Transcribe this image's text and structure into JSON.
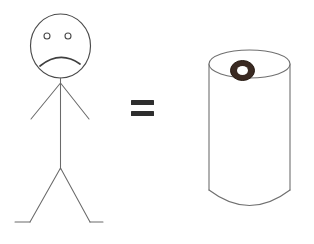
{
  "image": {
    "title": "Stick figure equals coffee cup",
    "background_color": "#ffffff",
    "width": 314,
    "height": 244,
    "style": "hand-drawn line sketch"
  },
  "elements": {
    "person": {
      "label": "sad stick figure person",
      "mood": "frowning",
      "stroke_color": "#5a5a5a",
      "head": {
        "label": "oval head",
        "center_x": 60.5,
        "center_y": 46,
        "radius_x": 30,
        "radius_y": 32
      },
      "eyes": [
        {
          "label": "left eye",
          "cx": 47,
          "cy": 36,
          "r": 3
        },
        {
          "label": "right eye",
          "cx": 68,
          "cy": 36,
          "r": 3
        }
      ],
      "mouth": {
        "label": "frowning mouth arc",
        "path": "M 40 66 Q 60 50 80 64",
        "stroke_color": "#3f3f3f"
      },
      "neck": {
        "x1": 60.5,
        "y1": 78,
        "x2": 60.5,
        "y2": 84
      },
      "torso": {
        "x1": 60.5,
        "y1": 82,
        "x2": 60.5,
        "y2": 169
      },
      "arms": [
        {
          "label": "left arm",
          "x1": 60.5,
          "y1": 83,
          "x2": 31,
          "y2": 119
        },
        {
          "label": "right arm",
          "x1": 60.5,
          "y1": 83,
          "x2": 89,
          "y2": 119
        }
      ],
      "legs": [
        {
          "label": "left leg",
          "x1": 60.5,
          "y1": 168,
          "x2": 30,
          "y2": 222
        },
        {
          "label": "right leg",
          "x1": 60.5,
          "y1": 168,
          "x2": 90,
          "y2": 222
        }
      ],
      "feet": [
        {
          "label": "left foot",
          "x1": 30,
          "y1": 222,
          "x2": 15,
          "y2": 222
        },
        {
          "label": "right foot",
          "x1": 90,
          "y1": 222,
          "x2": 103,
          "y2": 222
        }
      ]
    },
    "equals_sign": {
      "label": "equals sign",
      "symbol": "=",
      "color": "#2e2e2e",
      "bars": [
        {
          "x": 131,
          "y": 100,
          "width": 23,
          "height": 5
        },
        {
          "x": 131,
          "y": 111,
          "width": 23,
          "height": 5
        }
      ]
    },
    "cup": {
      "label": "coffee cup cylinder with dark ring on top",
      "stroke_color": "#6f6f6f",
      "top_ellipse": {
        "cx": 249.5,
        "cy": 64,
        "rx": 40.5,
        "ry": 14
      },
      "left_side": {
        "x1": 209,
        "y1": 64,
        "x2": 209,
        "y2": 190
      },
      "right_side": {
        "x1": 290,
        "y1": 64,
        "x2": 290,
        "y2": 190
      },
      "bottom_arc": "M 209 190 Q 249.5 221 290 190",
      "ring": {
        "label": "dark coffee ring",
        "cx": 242.5,
        "cy": 70.5,
        "outer_rx": 12,
        "outer_ry": 10,
        "inner_rx": 5.5,
        "inner_ry": 4.5,
        "color": "#3a2a22",
        "hole_color": "#ffffff"
      }
    }
  }
}
